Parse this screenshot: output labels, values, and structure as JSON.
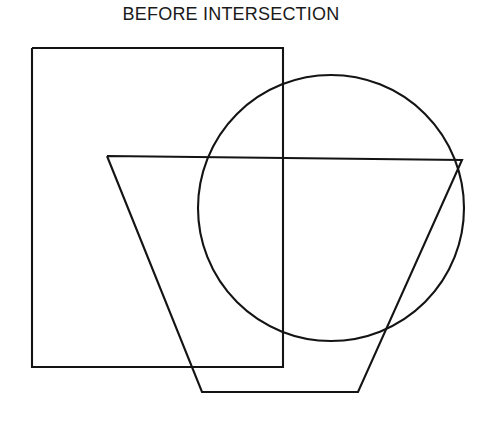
{
  "figure": {
    "title": "BEFORE INTERSECTION",
    "title_x": 231,
    "title_y": 20,
    "background_color": "#ffffff",
    "stroke_color": "#141414",
    "stroke_width": 2.1,
    "canvas": {
      "width": 484,
      "height": 425
    }
  },
  "shapes": {
    "rectangle": {
      "name": "rectangle",
      "x": 32,
      "y": 48,
      "width": 251,
      "height": 319,
      "points": "32,48 283,48 283,367 32,367 32,48"
    },
    "circle": {
      "name": "circle",
      "cx": 331,
      "cy": 208,
      "r": 133
    },
    "trapezoid": {
      "name": "trapezoid",
      "points": "107,156 462,160 358,392 202,392 107,156"
    }
  },
  "chart_data": {
    "type": "diagram",
    "title": "BEFORE INTERSECTION",
    "elements": [
      {
        "shape": "rectangle",
        "vertices": [
          [
            32,
            48
          ],
          [
            283,
            48
          ],
          [
            283,
            367
          ],
          [
            32,
            367
          ]
        ]
      },
      {
        "shape": "circle",
        "center": [
          331,
          208
        ],
        "radius": 133
      },
      {
        "shape": "trapezoid",
        "vertices": [
          [
            107,
            156
          ],
          [
            462,
            160
          ],
          [
            358,
            392
          ],
          [
            202,
            392
          ]
        ]
      }
    ],
    "xlabel": "",
    "ylabel": "",
    "legend": []
  }
}
